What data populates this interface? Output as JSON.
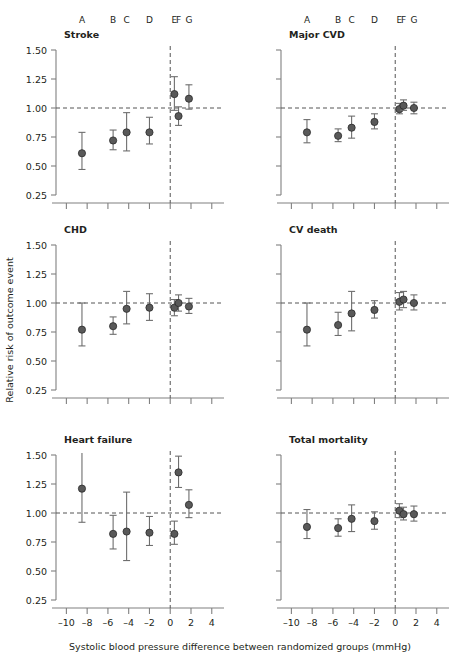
{
  "figure": {
    "xlabel": "Systolic blood pressure difference between randomized groups (mmHg)",
    "ylabel": "Relative risk of outcome event",
    "group_letters": [
      "A",
      "B",
      "C",
      "D",
      "E",
      "F",
      "G"
    ],
    "xticks": [
      -10,
      -8,
      -6,
      -4,
      -2,
      0,
      2,
      4
    ],
    "xtick_labels": [
      "–10",
      "–8",
      "–6",
      "–4",
      "–2",
      "0",
      "2",
      "4"
    ],
    "yticks": [
      0.25,
      0.5,
      0.75,
      1.0,
      1.25,
      1.5
    ],
    "ytick_labels": [
      "0.25",
      "0.50",
      "0.75",
      "1.00",
      "1.25",
      "1.50"
    ],
    "xlim": [
      -11.0,
      4.6
    ],
    "ylim": [
      0.25,
      1.5
    ],
    "reference_line_y": 1.0,
    "reference_line_x": 0,
    "marker_color": "#595959",
    "axis_color": "#808080",
    "dash_color": "#555555"
  },
  "chart_data": [
    {
      "type": "scatter",
      "title": "Stroke",
      "panel": "top-left",
      "xlabel": "Systolic blood pressure difference between randomized groups (mmHg)",
      "ylabel": "Relative risk of outcome event",
      "xlim": [
        -11.0,
        4.6
      ],
      "ylim": [
        0.25,
        1.5
      ],
      "grid": false,
      "reference_line_y": 1.0,
      "reference_line_x": 0,
      "points": [
        {
          "label": "A",
          "x": -8.5,
          "y": 0.61,
          "lo": 0.47,
          "hi": 0.79
        },
        {
          "label": "B",
          "x": -5.5,
          "y": 0.72,
          "lo": 0.64,
          "hi": 0.81
        },
        {
          "label": "C",
          "x": -4.2,
          "y": 0.79,
          "lo": 0.63,
          "hi": 0.96
        },
        {
          "label": "D",
          "x": -2.0,
          "y": 0.79,
          "lo": 0.69,
          "hi": 0.92
        },
        {
          "label": "E",
          "x": 0.4,
          "y": 1.12,
          "lo": 0.98,
          "hi": 1.27
        },
        {
          "label": "F",
          "x": 0.8,
          "y": 0.93,
          "lo": 0.85,
          "hi": 1.01
        },
        {
          "label": "G",
          "x": 1.8,
          "y": 1.08,
          "lo": 0.99,
          "hi": 1.2
        }
      ]
    },
    {
      "type": "scatter",
      "title": "Major CVD",
      "panel": "top-right",
      "xlabel": "Systolic blood pressure difference between randomized groups (mmHg)",
      "ylabel": "Relative risk of outcome event",
      "xlim": [
        -11.0,
        4.6
      ],
      "ylim": [
        0.25,
        1.5
      ],
      "grid": false,
      "reference_line_y": 1.0,
      "reference_line_x": 0,
      "points": [
        {
          "label": "A",
          "x": -8.5,
          "y": 0.79,
          "lo": 0.7,
          "hi": 0.9
        },
        {
          "label": "B",
          "x": -5.5,
          "y": 0.76,
          "lo": 0.71,
          "hi": 0.82
        },
        {
          "label": "C",
          "x": -4.2,
          "y": 0.83,
          "lo": 0.74,
          "hi": 0.93
        },
        {
          "label": "D",
          "x": -2.0,
          "y": 0.88,
          "lo": 0.82,
          "hi": 0.95
        },
        {
          "label": "E",
          "x": 0.4,
          "y": 0.99,
          "lo": 0.95,
          "hi": 1.04
        },
        {
          "label": "F",
          "x": 0.8,
          "y": 1.02,
          "lo": 0.98,
          "hi": 1.07
        },
        {
          "label": "G",
          "x": 1.8,
          "y": 1.0,
          "lo": 0.95,
          "hi": 1.05
        }
      ]
    },
    {
      "type": "scatter",
      "title": "CHD",
      "panel": "middle-left",
      "xlabel": "Systolic blood pressure difference between randomized groups (mmHg)",
      "ylabel": "Relative risk of outcome event",
      "xlim": [
        -11.0,
        4.6
      ],
      "ylim": [
        0.25,
        1.5
      ],
      "grid": false,
      "reference_line_y": 1.0,
      "reference_line_x": 0,
      "points": [
        {
          "label": "A",
          "x": -8.5,
          "y": 0.77,
          "lo": 0.63,
          "hi": 1.0
        },
        {
          "label": "B",
          "x": -5.5,
          "y": 0.8,
          "lo": 0.73,
          "hi": 0.88
        },
        {
          "label": "C",
          "x": -4.2,
          "y": 0.95,
          "lo": 0.82,
          "hi": 1.1
        },
        {
          "label": "D",
          "x": -2.0,
          "y": 0.96,
          "lo": 0.85,
          "hi": 1.08
        },
        {
          "label": "E",
          "x": 0.4,
          "y": 0.96,
          "lo": 0.89,
          "hi": 1.03
        },
        {
          "label": "F",
          "x": 0.8,
          "y": 1.0,
          "lo": 0.93,
          "hi": 1.07
        },
        {
          "label": "G",
          "x": 1.8,
          "y": 0.97,
          "lo": 0.91,
          "hi": 1.04
        }
      ]
    },
    {
      "type": "scatter",
      "title": "CV death",
      "panel": "middle-right",
      "xlabel": "Systolic blood pressure difference between randomized groups (mmHg)",
      "ylabel": "Relative risk of outcome event",
      "xlim": [
        -11.0,
        4.6
      ],
      "ylim": [
        0.25,
        1.5
      ],
      "grid": false,
      "reference_line_y": 1.0,
      "reference_line_x": 0,
      "points": [
        {
          "label": "A",
          "x": -8.5,
          "y": 0.77,
          "lo": 0.63,
          "hi": 1.0
        },
        {
          "label": "B",
          "x": -5.5,
          "y": 0.81,
          "lo": 0.72,
          "hi": 0.92
        },
        {
          "label": "C",
          "x": -4.2,
          "y": 0.91,
          "lo": 0.76,
          "hi": 1.1
        },
        {
          "label": "D",
          "x": -2.0,
          "y": 0.94,
          "lo": 0.87,
          "hi": 1.02
        },
        {
          "label": "E",
          "x": 0.4,
          "y": 1.01,
          "lo": 0.94,
          "hi": 1.09
        },
        {
          "label": "F",
          "x": 0.8,
          "y": 1.03,
          "lo": 0.96,
          "hi": 1.1
        },
        {
          "label": "G",
          "x": 1.8,
          "y": 1.0,
          "lo": 0.94,
          "hi": 1.07
        }
      ]
    },
    {
      "type": "scatter",
      "title": "Heart failure",
      "panel": "bottom-left",
      "xlabel": "Systolic blood pressure difference between randomized groups (mmHg)",
      "ylabel": "Relative risk of outcome event",
      "xlim": [
        -11.0,
        4.6
      ],
      "ylim": [
        0.25,
        1.5
      ],
      "grid": false,
      "reference_line_y": 1.0,
      "reference_line_x": 0,
      "points": [
        {
          "label": "A",
          "x": -8.5,
          "y": 1.21,
          "lo": 0.92,
          "hi": 1.62
        },
        {
          "label": "B",
          "x": -5.5,
          "y": 0.82,
          "lo": 0.69,
          "hi": 0.98
        },
        {
          "label": "C",
          "x": -4.2,
          "y": 0.84,
          "lo": 0.59,
          "hi": 1.18
        },
        {
          "label": "D",
          "x": -2.0,
          "y": 0.83,
          "lo": 0.72,
          "hi": 0.97
        },
        {
          "label": "E",
          "x": 0.4,
          "y": 0.82,
          "lo": 0.73,
          "hi": 0.93
        },
        {
          "label": "F",
          "x": 0.8,
          "y": 1.35,
          "lo": 1.22,
          "hi": 1.49
        },
        {
          "label": "G",
          "x": 1.8,
          "y": 1.07,
          "lo": 0.96,
          "hi": 1.2
        }
      ]
    },
    {
      "type": "scatter",
      "title": "Total mortality",
      "panel": "bottom-right",
      "xlabel": "Systolic blood pressure difference between randomized groups (mmHg)",
      "ylabel": "Relative risk of outcome event",
      "xlim": [
        -11.0,
        4.6
      ],
      "ylim": [
        0.25,
        1.5
      ],
      "grid": false,
      "reference_line_y": 1.0,
      "reference_line_x": 0,
      "points": [
        {
          "label": "A",
          "x": -8.5,
          "y": 0.88,
          "lo": 0.78,
          "hi": 1.03
        },
        {
          "label": "B",
          "x": -5.5,
          "y": 0.87,
          "lo": 0.8,
          "hi": 0.95
        },
        {
          "label": "C",
          "x": -4.2,
          "y": 0.95,
          "lo": 0.84,
          "hi": 1.07
        },
        {
          "label": "D",
          "x": -2.0,
          "y": 0.93,
          "lo": 0.86,
          "hi": 1.01
        },
        {
          "label": "E",
          "x": 0.4,
          "y": 1.02,
          "lo": 0.96,
          "hi": 1.08
        },
        {
          "label": "F",
          "x": 0.8,
          "y": 0.99,
          "lo": 0.94,
          "hi": 1.05
        },
        {
          "label": "G",
          "x": 1.8,
          "y": 0.99,
          "lo": 0.93,
          "hi": 1.06
        }
      ]
    }
  ]
}
